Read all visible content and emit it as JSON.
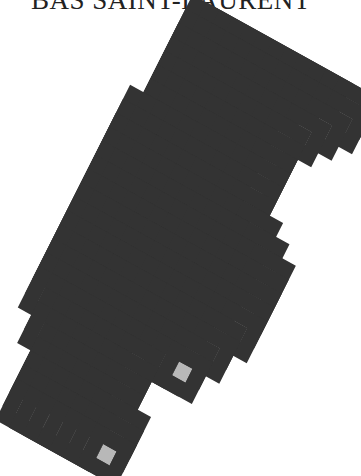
{
  "map": {
    "title": "BAS SAINT-LAURENT",
    "colors": {
      "cell_fill": "#b8b8b8",
      "cell_border": "#333333",
      "selected_fill": "#050505",
      "background": "#ffffff"
    },
    "grid": {
      "origin_px": [
        199,
        16
      ],
      "u_vector_px": [
        13.39,
        7.42
      ],
      "v_vector_px": [
        -7.02,
        13.93
      ],
      "rows": [
        {
          "row": 0,
          "from": 0,
          "to": 11
        },
        {
          "row": 1,
          "from": 0,
          "to": 11
        },
        {
          "row": 2,
          "from": 0,
          "to": 10
        },
        {
          "row": 3,
          "from": 0,
          "to": 9
        },
        {
          "row": 4,
          "from": 0,
          "to": 8
        },
        {
          "row": 5,
          "from": 0,
          "to": 8
        },
        {
          "row": 6,
          "from": 0,
          "to": 8
        },
        {
          "row": 7,
          "from": -1,
          "to": 8
        },
        {
          "row": 8,
          "from": -1,
          "to": 8
        },
        {
          "row": 9,
          "from": -1,
          "to": 8
        },
        {
          "row": 10,
          "from": -1,
          "to": 9
        },
        {
          "row": 11,
          "from": -1,
          "to": 10
        },
        {
          "row": 12,
          "from": -1,
          "to": 11
        },
        {
          "row": 13,
          "from": -1,
          "to": 11
        },
        {
          "row": 14,
          "from": -1,
          "to": 11
        },
        {
          "row": 15,
          "from": -1,
          "to": 11
        },
        {
          "row": 16,
          "from": -1,
          "to": 11
        },
        {
          "row": 17,
          "from": -1,
          "to": 10
        },
        {
          "row": 18,
          "from": -1,
          "to": 10
        },
        {
          "row": 19,
          "from": -1,
          "to": 9
        },
        {
          "row": 20,
          "from": -1,
          "to": 9
        },
        {
          "row": 21,
          "from": 0,
          "to": 6
        },
        {
          "row": 22,
          "from": 0,
          "to": 6
        },
        {
          "row": 23,
          "from": 1,
          "to": 6
        },
        {
          "row": 24,
          "from": 1,
          "to": 6
        },
        {
          "row": 25,
          "from": 1,
          "to": 7
        },
        {
          "row": 26,
          "from": 1,
          "to": 7
        },
        {
          "row": 27,
          "from": 1,
          "to": 7
        }
      ],
      "selected_cells": [
        {
          "row": 14,
          "col": -1
        }
      ]
    }
  }
}
